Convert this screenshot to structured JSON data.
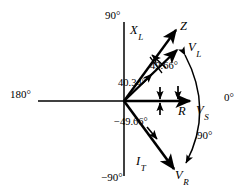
{
  "figure": {
    "type": "phasor-diagram",
    "background_color": "#ffffff",
    "stroke_color": "#000000",
    "width": 249,
    "height": 193
  },
  "axes": {
    "origin": {
      "x": 124,
      "y": 101
    },
    "labels": {
      "right": "0°",
      "top": "90°",
      "left": "180°",
      "bottom": "−90°"
    },
    "reactance_axis_label": "X",
    "reactance_axis_subscript": "L"
  },
  "vectors": [
    {
      "name": "Z",
      "label": "Z",
      "subscript": "",
      "angle_deg": 49.66,
      "length_px": 75,
      "description": "impedance phasor"
    },
    {
      "name": "V_L",
      "label": "V",
      "subscript": "L",
      "angle_deg": 40.34,
      "length_px": 73,
      "description": "inductor voltage phasor"
    },
    {
      "name": "V_S",
      "label": "V",
      "subscript": "S",
      "angle_deg": 0,
      "length_px": 68,
      "description": "source voltage phasor along 0 degrees"
    },
    {
      "name": "R",
      "label": "R",
      "subscript": "",
      "angle_deg": 0,
      "length_px": 55,
      "description": "resistance along real axis"
    },
    {
      "name": "I_T",
      "label": "I",
      "subscript": "T",
      "angle_deg": -49.66,
      "length_px": 81,
      "description": "total current phasor"
    },
    {
      "name": "V_R",
      "label": "V",
      "subscript": "R",
      "angle_deg": -49.66,
      "length_px": 81,
      "description": "resistor voltage phasor, collinear with total current"
    }
  ],
  "angle_annotations": [
    {
      "id": "angle-z",
      "value": "49.66°",
      "degrees": 49.66,
      "measured_from": "0° axis",
      "applies_to": "Z"
    },
    {
      "id": "angle-vl",
      "value": "40.34°",
      "degrees": 40.34,
      "measured_from": "0° axis",
      "applies_to": "V_L"
    },
    {
      "id": "angle-it",
      "value": "−49.66°",
      "degrees": -49.66,
      "measured_from": "0° axis",
      "applies_to": "I_T and V_R"
    }
  ],
  "arc_annotation": {
    "id": "arc-90",
    "value": "90°",
    "degrees": 90,
    "from_vector": "V_L",
    "to_vector": "V_R",
    "description": "curved double-headed arc spanning 90 degrees between V_L and V_R"
  }
}
